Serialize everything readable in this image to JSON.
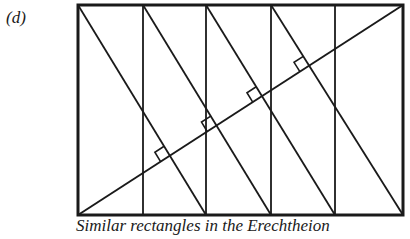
{
  "figure": {
    "label": "(d)",
    "caption": "Similar rectangles in the Erechtheion",
    "stroke_color": "#1a1a1a",
    "frame": {
      "x": 78,
      "y": 5,
      "width": 325,
      "height": 210
    },
    "verticals_x": [
      143,
      206,
      271,
      335
    ],
    "main_diagonal": {
      "from": [
        78,
        215
      ],
      "to": [
        403,
        5
      ]
    },
    "panel_diagonals": [
      {
        "from": [
          78,
          5
        ],
        "to": [
          206,
          215
        ]
      },
      {
        "from": [
          143,
          5
        ],
        "to": [
          271,
          215
        ]
      },
      {
        "from": [
          206,
          5
        ],
        "to": [
          335,
          215
        ]
      },
      {
        "from": [
          271,
          5
        ],
        "to": [
          403,
          215
        ]
      }
    ],
    "right_angle_markers": 4
  }
}
